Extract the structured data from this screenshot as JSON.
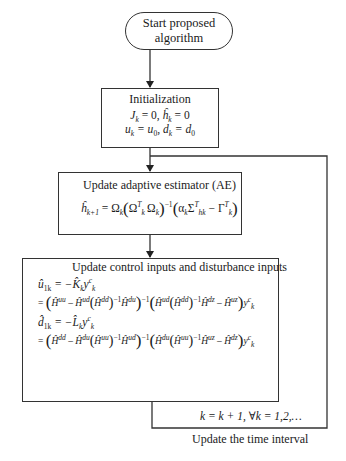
{
  "diagram": {
    "type": "flowchart",
    "nodes": [
      {
        "id": "start",
        "shape": "terminal",
        "lines": [
          "Start proposed",
          "algorithm"
        ]
      },
      {
        "id": "init",
        "shape": "process",
        "title": "Initialization",
        "equations": [
          "J_k = 0, ĥ̂_k = 0",
          "u_k = u_0, d_k = d_0"
        ]
      },
      {
        "id": "ae",
        "shape": "process",
        "title": "Update adaptive estimator (AE)",
        "equations": [
          "ĥ̂_{k+1} = Ω_k(Ω_k^T Ω_k)^{-1}(α_k Σ_{hk}^T − Γ_k^T)"
        ]
      },
      {
        "id": "control",
        "shape": "process",
        "title": "Update control inputs and disturbance inputs",
        "equations": [
          "û_{1k} = −K̂_k y_k^c",
          "= (H^uu − H^ud (H^dd)^{-1} H^du)^{-1} (H^ud (H^dd)^{-1} H^dz − H^uz) y_k^c",
          "d̂_{1k} = −L̂_k y_k^c",
          "= (H^dd − H^du (H^uu)^{-1} H^ud)^{-1} (H^du (H^uu)^{-1} H^uz − H^dz) y_k^c"
        ]
      }
    ],
    "edges": [
      {
        "from": "start",
        "to": "init"
      },
      {
        "from": "init",
        "to": "ae"
      },
      {
        "from": "ae",
        "to": "control"
      },
      {
        "from": "control",
        "to": "ae",
        "label": "k = k + 1, ∀k = 1,2,…",
        "caption": "Update the time interval"
      }
    ]
  },
  "start": {
    "line1": "Start proposed",
    "line2": "algorithm"
  },
  "init": {
    "title": "Initialization",
    "eq1": {
      "J": "J",
      "k": "k",
      "eq": " = 0, ",
      "h": "ĥ",
      "k2": "k",
      "tail": " = 0"
    },
    "eq2": {
      "u": "u",
      "k": "k",
      "mid": " = u",
      "zero": "0",
      "sep": ", d",
      "k2": "k",
      "tail": " = d",
      "zero2": "0"
    }
  },
  "ae": {
    "title": "Update adaptive estimator (AE)",
    "lhs": "ĥ",
    "lhs_sub": "k+1",
    "eq": " = Ω",
    "omega_sub": "k",
    "inner": "Ω",
    "inner_sup": "T",
    "inner_sub": "k",
    "inner2": "Ω",
    "inner2_sub": "k",
    "inv": "−1",
    "alpha": "α",
    "alpha_sub": "k",
    "sigma": "Σ",
    "sigma_sup": "T",
    "sigma_sub": "hk",
    "minus": " − ",
    "gamma": "Γ",
    "gamma_sup": "T",
    "gamma_sub": "k"
  },
  "control": {
    "title": "Update control inputs and disturbance inputs",
    "u_line": {
      "lhs": "û",
      "lhs_sub": "1k",
      "rhs": " = −K̂",
      "rhs_sub": "k",
      "y": "y",
      "y_sup": "c",
      "y_sub": "k"
    },
    "u_expr": {
      "a": "Ĥ",
      "a_sup": "uu",
      "minus": " – ",
      "b": "Ĥ",
      "b_sup": "ud",
      "c": "Ĥ",
      "c_sup": "dd",
      "inv": "−1",
      "d": "Ĥ",
      "d_sup": "du",
      "e": "Ĥ",
      "e_sup": "ud",
      "f": "Ĥ",
      "f_sup": "dd",
      "g": "Ĥ",
      "g_sup": "dz",
      "h": "Ĥ",
      "h_sup": "uz"
    },
    "d_line": {
      "lhs": "d̂",
      "lhs_sub": "1k",
      "rhs": " = −L̂",
      "rhs_sub": "k",
      "y": "y",
      "y_sup": "c",
      "y_sub": "k"
    },
    "d_expr": {
      "a": "Ĥ",
      "a_sup": "dd",
      "minus": " – ",
      "b": "Ĥ",
      "b_sup": "du",
      "c": "Ĥ",
      "c_sup": "uu",
      "inv": "−1",
      "d": "Ĥ",
      "d_sup": "ud",
      "e": "Ĥ",
      "e_sup": "du",
      "f": "Ĥ",
      "f_sup": "uu",
      "g": "Ĥ",
      "g_sup": "uz",
      "h": "Ĥ",
      "h_sup": "dz"
    },
    "eq_sign": "= ",
    "sup_k": "k"
  },
  "loop": {
    "label": "k = k + 1, ∀k = 1,2,…",
    "caption": "Update the time interval"
  },
  "colors": {
    "line": "#333333",
    "text": "#1a1a1a",
    "background": "#ffffff"
  }
}
